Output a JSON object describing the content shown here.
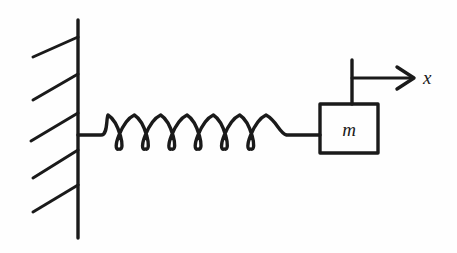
{
  "figure": {
    "background_color": "#fefefe",
    "ink_color": "#1a1a1a",
    "width": 457,
    "height": 253
  },
  "labels": {
    "mass_label": "m",
    "axis_label": "x"
  },
  "wall": {
    "name": "fixed-wall",
    "vertical_line": {
      "x": 78,
      "y_top": 20,
      "y_bottom": 238
    },
    "hatch_count": 5,
    "hatch_marks": [
      {
        "x1": 33,
        "y1": 57,
        "x2": 78,
        "y2": 37
      },
      {
        "x1": 33,
        "y1": 100,
        "x2": 78,
        "y2": 74
      },
      {
        "x1": 31,
        "y1": 141,
        "x2": 78,
        "y2": 113
      },
      {
        "x1": 33,
        "y1": 178,
        "x2": 78,
        "y2": 150
      },
      {
        "x1": 33,
        "y1": 212,
        "x2": 78,
        "y2": 185
      }
    ]
  },
  "spring": {
    "name": "coil-spring",
    "coil_count": 6,
    "attach_x": 78,
    "lead_in_end_x": 105,
    "coil_start_x": 108,
    "coil_end_x": 266,
    "baseline_y": 135,
    "coil_top_y": 115,
    "coil_bottom_y": 149,
    "lead_out_end_x": 320
  },
  "mass_block": {
    "name": "mass-block",
    "x": 320,
    "y": 104,
    "width": 58,
    "height": 49
  },
  "axis": {
    "name": "displacement-axis",
    "reference_line": {
      "x": 352,
      "y_top": 60,
      "y_bottom": 104
    },
    "arrow": {
      "x_start": 352,
      "x_end": 414,
      "y": 78
    },
    "label_position": {
      "x": 423,
      "y": 84
    }
  },
  "chart_data": {
    "type": "diagram",
    "elements": [
      {
        "id": "wall",
        "kind": "fixed-support",
        "label": ""
      },
      {
        "id": "spring",
        "kind": "coil-spring",
        "label": "",
        "coils": 6
      },
      {
        "id": "mass",
        "kind": "block",
        "label": "m"
      },
      {
        "id": "axis",
        "kind": "arrow",
        "label": "x",
        "direction": "right"
      }
    ]
  }
}
